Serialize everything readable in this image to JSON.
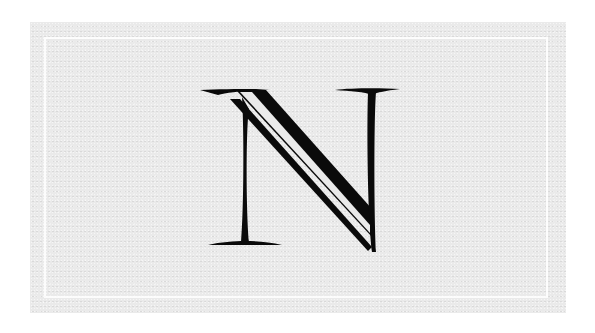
{
  "logo": {
    "letter": "N",
    "style": "inline serif capital",
    "ink_color": "#0a0a0a",
    "paper_color": "#eaeaea",
    "border_color": "#ffffff"
  }
}
